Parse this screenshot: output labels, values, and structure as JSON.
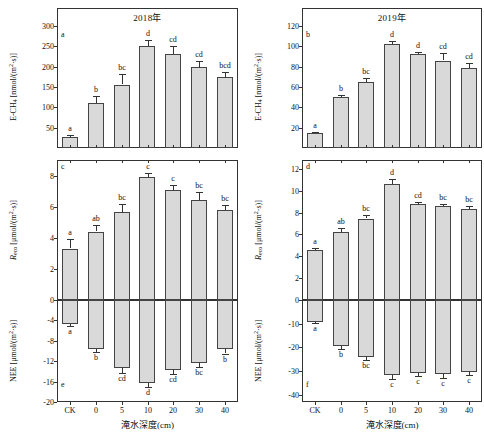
{
  "figure": {
    "xlabel": "淹水深度(cm)",
    "categories": [
      "CK",
      "0",
      "5",
      "10",
      "20",
      "30",
      "40"
    ],
    "column_titles": [
      "2018年",
      "2019年"
    ],
    "bar_color": "#d9d9d9",
    "bar_edge_color": "#444444"
  },
  "chart_data": [
    {
      "type": "bar",
      "panel": "a",
      "title": "2018年",
      "xlabel": "淹水深度(cm)",
      "ylabel": "E-CH4 [nmol/(m2·s)]",
      "categories": [
        "CK",
        "0",
        "5",
        "10",
        "20",
        "30",
        "40"
      ],
      "values": [
        28,
        111,
        156,
        251,
        230,
        198,
        174
      ],
      "errors": [
        4,
        18,
        25,
        14,
        20,
        17,
        14
      ],
      "sig_letters": [
        "a",
        "b",
        "bc",
        "d",
        "cd",
        "cd",
        "bcd"
      ],
      "yticks": [
        50,
        100,
        150,
        200,
        250,
        300
      ],
      "ylim": [
        0,
        300
      ],
      "grid": false
    },
    {
      "type": "bar",
      "panel": "b",
      "title": "2019年",
      "xlabel": "淹水深度(cm)",
      "ylabel": "E-CH4 [nmol/(m2·s)]",
      "categories": [
        "CK",
        "0",
        "5",
        "10",
        "20",
        "30",
        "40"
      ],
      "values": [
        15,
        50,
        65,
        102,
        92,
        86,
        79
      ],
      "errors": [
        1,
        2,
        4,
        3,
        2,
        7,
        5
      ],
      "sig_letters": [
        "a",
        "b",
        "bc",
        "d",
        "d",
        "cd",
        "cd"
      ],
      "yticks": [
        20,
        40,
        60,
        80,
        100,
        120
      ],
      "ylim": [
        0,
        120
      ],
      "grid": false
    },
    {
      "type": "bar",
      "panel": "c",
      "title": "2018年",
      "xlabel": "淹水深度(cm)",
      "ylabel": "Reco [μmol/(m2·s)]",
      "categories": [
        "CK",
        "0",
        "5",
        "10",
        "20",
        "30",
        "40"
      ],
      "values": [
        3.3,
        4.4,
        5.65,
        7.9,
        7.05,
        6.45,
        5.8
      ],
      "errors": [
        0.6,
        0.4,
        0.55,
        0.25,
        0.35,
        0.5,
        0.3
      ],
      "sig_letters": [
        "a",
        "ab",
        "bc",
        "c",
        "c",
        "bc",
        "bc"
      ],
      "yticks": [
        0,
        2,
        4,
        6,
        8
      ],
      "ylim": [
        0,
        9
      ],
      "grid": false
    },
    {
      "type": "bar",
      "panel": "d",
      "title": "2019年",
      "xlabel": "淹水深度(cm)",
      "ylabel": "Reco [μmol/(m2·s)]",
      "categories": [
        "CK",
        "0",
        "5",
        "10",
        "20",
        "30",
        "40"
      ],
      "values": [
        4.6,
        6.2,
        7.45,
        10.6,
        8.75,
        8.6,
        8.3
      ],
      "errors": [
        0.15,
        0.35,
        0.3,
        0.45,
        0.25,
        0.2,
        0.25
      ],
      "sig_letters": [
        "a",
        "ab",
        "bc",
        "d",
        "cd",
        "bc",
        "bc"
      ],
      "yticks": [
        0,
        2,
        4,
        6,
        8,
        10,
        12
      ],
      "ylim": [
        0,
        12.8
      ],
      "grid": false
    },
    {
      "type": "bar",
      "panel": "e",
      "title": "2018年",
      "xlabel": "淹水深度(cm)",
      "ylabel": "NEE [μmol/(m2·s)]",
      "categories": [
        "CK",
        "0",
        "5",
        "10",
        "20",
        "30",
        "40"
      ],
      "values": [
        -4.7,
        -9.6,
        -13.3,
        -16.2,
        -13.8,
        -12.4,
        -9.7
      ],
      "errors": [
        0.4,
        0.6,
        1.0,
        0.9,
        0.8,
        0.7,
        0.8
      ],
      "sig_letters": [
        "a",
        "b",
        "cd",
        "d",
        "cd",
        "bc",
        "b"
      ],
      "yticks": [
        -4,
        -8,
        -12,
        -16,
        -20
      ],
      "ylim": [
        -20,
        0
      ],
      "grid": false
    },
    {
      "type": "bar",
      "panel": "f",
      "title": "2019年",
      "xlabel": "淹水深度(cm)",
      "ylabel": "NEE [μmol/(m2·s)]",
      "categories": [
        "CK",
        "0",
        "5",
        "10",
        "20",
        "30",
        "40"
      ],
      "values": [
        -9.3,
        -19.5,
        -24.0,
        -31.5,
        -30.8,
        -31.3,
        -30.2
      ],
      "errors": [
        0.5,
        1.3,
        1.3,
        1.6,
        1.4,
        1.6,
        1.6
      ],
      "sig_letters": [
        "a",
        "b",
        "bc",
        "c",
        "c",
        "c",
        "c"
      ],
      "yticks": [
        -10,
        -20,
        -30,
        -40
      ],
      "ylim": [
        -43,
        0
      ],
      "grid": false
    }
  ],
  "axis_labels": {
    "ch4_main": "E-CH",
    "ch4_sub": "4",
    "ch4_units": " [nmol/(m",
    "reco_main": "R",
    "reco_sub": "eco",
    "reco_units": " [μmol/(m",
    "nee_main": "NEE",
    "nee_units": " [μmol/(m",
    "sup2": "2",
    "tail": "·s)]"
  }
}
